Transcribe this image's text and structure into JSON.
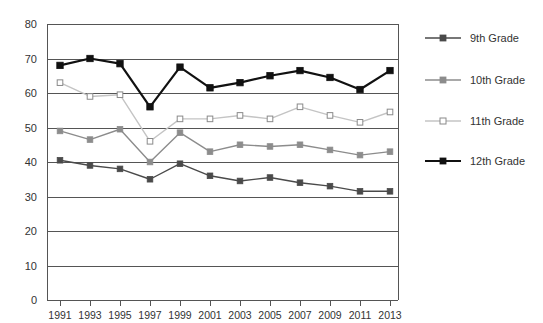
{
  "chart_data": {
    "type": "line",
    "title": "",
    "xlabel": "",
    "ylabel": "",
    "categories": [
      "1991",
      "1993",
      "1995",
      "1997",
      "1999",
      "2001",
      "2003",
      "2005",
      "2007",
      "2009",
      "2011",
      "2013"
    ],
    "x": [
      1991,
      1993,
      1995,
      1997,
      1999,
      2001,
      2003,
      2005,
      2007,
      2009,
      2011,
      2013
    ],
    "ylim": [
      0,
      80
    ],
    "y_ticks": [
      0,
      10,
      20,
      30,
      40,
      50,
      60,
      70,
      80
    ],
    "y_tick_labels": [
      "0",
      "10",
      "20",
      "30",
      "40",
      "50",
      "60",
      "70",
      "80"
    ],
    "grid": true,
    "legend_position": "right",
    "series": [
      {
        "name": "9th Grade",
        "color": "#4a4a4a",
        "marker": "filled-square",
        "line_width": 1.4,
        "values": [
          40.5,
          39.0,
          38.0,
          35.0,
          39.5,
          36.0,
          34.5,
          35.5,
          34.0,
          33.0,
          31.5,
          31.5
        ]
      },
      {
        "name": "10th Grade",
        "color": "#8c8c8c",
        "marker": "filled-square",
        "line_width": 1.4,
        "values": [
          49.0,
          46.5,
          49.5,
          40.0,
          48.5,
          43.0,
          45.0,
          44.5,
          45.0,
          43.5,
          42.0,
          43.0
        ]
      },
      {
        "name": "11th Grade",
        "color": "#c4c4c4",
        "marker": "open-square",
        "line_width": 1.4,
        "values": [
          63.0,
          59.0,
          59.5,
          46.0,
          52.5,
          52.5,
          53.5,
          52.5,
          56.0,
          53.5,
          51.5,
          54.5
        ]
      },
      {
        "name": "12th Grade",
        "color": "#111111",
        "marker": "filled-square",
        "line_width": 2.2,
        "values": [
          68.0,
          70.0,
          68.5,
          56.0,
          67.5,
          61.5,
          63.0,
          65.0,
          66.5,
          64.5,
          61.0,
          66.5
        ]
      }
    ]
  },
  "legend": {
    "items": [
      {
        "label": "9th Grade"
      },
      {
        "label": "10th Grade"
      },
      {
        "label": "11th Grade"
      },
      {
        "label": "12th Grade"
      }
    ]
  }
}
